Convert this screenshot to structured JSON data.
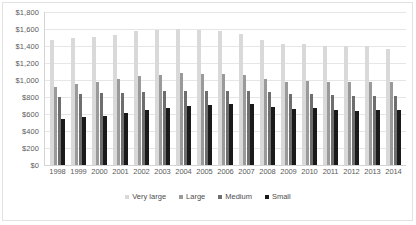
{
  "chart_data": {
    "type": "bar",
    "title": "",
    "subtitle": "",
    "xlabel": "",
    "ylabel": "",
    "ylim": [
      0,
      1800
    ],
    "grid": true,
    "legend_position": "bottom",
    "y_tick_labels": [
      "$1,800",
      "$1,600",
      "$1,400",
      "$1,200",
      "$1,000",
      "$800",
      "$600",
      "$400",
      "$200",
      "$0"
    ],
    "y_tick_values": [
      1800,
      1600,
      1400,
      1200,
      1000,
      800,
      600,
      400,
      200,
      0
    ],
    "categories": [
      "1998",
      "1999",
      "2000",
      "2001",
      "2002",
      "2003",
      "2004",
      "2005",
      "2006",
      "2007",
      "2008",
      "2009",
      "2010",
      "2011",
      "2012",
      "2013",
      "2014"
    ],
    "series": [
      {
        "name": "Very large",
        "color": "#d9d9d9",
        "values": [
          1470,
          1500,
          1510,
          1530,
          1575,
          1590,
          1600,
          1590,
          1580,
          1540,
          1465,
          1425,
          1425,
          1395,
          1395,
          1395,
          1370
        ]
      },
      {
        "name": "Large",
        "color": "#9a9a9a",
        "values": [
          920,
          955,
          980,
          1010,
          1045,
          1060,
          1080,
          1075,
          1070,
          1055,
          1015,
          980,
          990,
          975,
          975,
          975,
          980
        ]
      },
      {
        "name": "Medium",
        "color": "#6e6e6e",
        "values": [
          805,
          840,
          845,
          850,
          860,
          870,
          870,
          870,
          870,
          875,
          860,
          835,
          840,
          820,
          810,
          815,
          815
        ]
      },
      {
        "name": "Small",
        "color": "#1a1a1a",
        "values": [
          540,
          570,
          580,
          610,
          645,
          670,
          690,
          705,
          715,
          715,
          685,
          660,
          665,
          650,
          640,
          645,
          645
        ]
      }
    ]
  },
  "legend": {
    "items": [
      {
        "label": "Very large"
      },
      {
        "label": "Large"
      },
      {
        "label": "Medium"
      },
      {
        "label": "Small"
      }
    ]
  }
}
